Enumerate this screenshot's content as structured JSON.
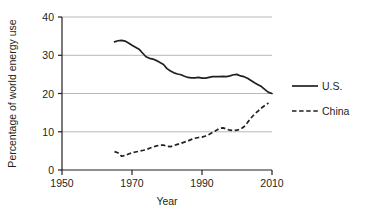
{
  "chart_data": {
    "type": "line",
    "title": "",
    "xlabel": "Year",
    "ylabel": "Percentage of world energy use",
    "xlim": [
      1950,
      2010
    ],
    "ylim": [
      0,
      40
    ],
    "xticks": [
      1950,
      1970,
      1990,
      2010
    ],
    "yticks": [
      0,
      10,
      20,
      30,
      40
    ],
    "grid": "horizontal",
    "legend_position": "right",
    "series": [
      {
        "name": "U.S.",
        "style": "solid",
        "color": "#231f20",
        "points": [
          [
            1965,
            33.5
          ],
          [
            1966,
            33.8
          ],
          [
            1967,
            33.9
          ],
          [
            1968,
            33.7
          ],
          [
            1969,
            33.2
          ],
          [
            1970,
            32.6
          ],
          [
            1971,
            32.1
          ],
          [
            1972,
            31.6
          ],
          [
            1973,
            30.6
          ],
          [
            1974,
            29.6
          ],
          [
            1975,
            29.2
          ],
          [
            1976,
            29.0
          ],
          [
            1977,
            28.6
          ],
          [
            1978,
            28.1
          ],
          [
            1979,
            27.6
          ],
          [
            1980,
            26.5
          ],
          [
            1981,
            25.9
          ],
          [
            1982,
            25.4
          ],
          [
            1983,
            25.1
          ],
          [
            1984,
            24.9
          ],
          [
            1985,
            24.5
          ],
          [
            1986,
            24.2
          ],
          [
            1987,
            24.1
          ],
          [
            1988,
            24.1
          ],
          [
            1989,
            24.2
          ],
          [
            1990,
            24.0
          ],
          [
            1991,
            24.0
          ],
          [
            1992,
            24.2
          ],
          [
            1993,
            24.4
          ],
          [
            1994,
            24.4
          ],
          [
            1995,
            24.4
          ],
          [
            1996,
            24.5
          ],
          [
            1997,
            24.4
          ],
          [
            1998,
            24.6
          ],
          [
            1999,
            24.9
          ],
          [
            2000,
            25.0
          ],
          [
            2001,
            24.6
          ],
          [
            2002,
            24.4
          ],
          [
            2003,
            24.0
          ],
          [
            2004,
            23.4
          ],
          [
            2005,
            22.8
          ],
          [
            2006,
            22.3
          ],
          [
            2007,
            21.8
          ],
          [
            2008,
            21.0
          ],
          [
            2009,
            20.3
          ],
          [
            2010,
            20.0
          ]
        ]
      },
      {
        "name": "China",
        "style": "dashed",
        "color": "#231f20",
        "points": [
          [
            1965,
            4.8
          ],
          [
            1966,
            4.5
          ],
          [
            1967,
            3.6
          ],
          [
            1968,
            3.8
          ],
          [
            1969,
            4.2
          ],
          [
            1970,
            4.5
          ],
          [
            1971,
            4.7
          ],
          [
            1972,
            4.9
          ],
          [
            1973,
            5.1
          ],
          [
            1974,
            5.3
          ],
          [
            1975,
            5.7
          ],
          [
            1976,
            6.0
          ],
          [
            1977,
            6.3
          ],
          [
            1978,
            6.5
          ],
          [
            1979,
            6.5
          ],
          [
            1980,
            6.2
          ],
          [
            1981,
            6.1
          ],
          [
            1982,
            6.4
          ],
          [
            1983,
            6.7
          ],
          [
            1984,
            7.0
          ],
          [
            1985,
            7.3
          ],
          [
            1986,
            7.6
          ],
          [
            1987,
            8.0
          ],
          [
            1988,
            8.3
          ],
          [
            1989,
            8.5
          ],
          [
            1990,
            8.6
          ],
          [
            1991,
            8.9
          ],
          [
            1992,
            9.3
          ],
          [
            1993,
            9.8
          ],
          [
            1994,
            10.3
          ],
          [
            1995,
            10.9
          ],
          [
            1996,
            11.0
          ],
          [
            1997,
            10.7
          ],
          [
            1998,
            10.4
          ],
          [
            1999,
            10.3
          ],
          [
            2000,
            10.4
          ],
          [
            2001,
            10.7
          ],
          [
            2002,
            11.3
          ],
          [
            2003,
            12.4
          ],
          [
            2004,
            13.6
          ],
          [
            2005,
            14.6
          ],
          [
            2006,
            15.4
          ],
          [
            2007,
            16.2
          ],
          [
            2008,
            16.9
          ],
          [
            2009,
            17.5
          ]
        ]
      }
    ]
  },
  "axes": {
    "y_title": "Percentage of world energy use",
    "x_title": "Year",
    "y_tick_labels": [
      "40",
      "30",
      "20",
      "10",
      "0"
    ],
    "x_tick_labels": [
      "1950",
      "1970",
      "1990",
      "2010"
    ]
  },
  "legend": {
    "items": [
      {
        "label": "U.S.",
        "style": "solid"
      },
      {
        "label": "China",
        "style": "dashed"
      }
    ]
  }
}
